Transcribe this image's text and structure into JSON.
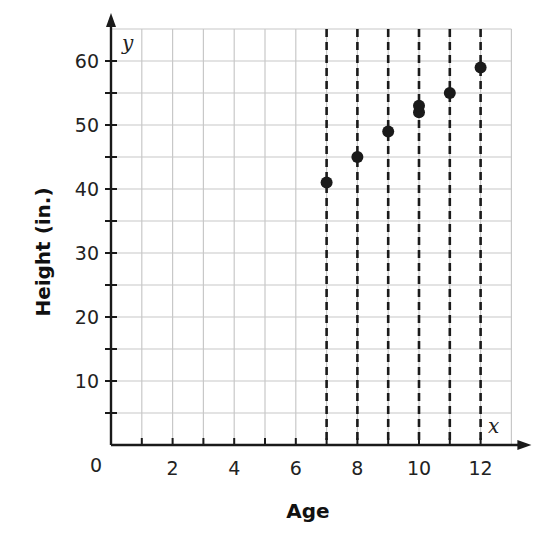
{
  "chart_data": {
    "type": "scatter",
    "title": "",
    "xlabel": "Age",
    "ylabel": "Height (in.)",
    "x_axis_variable": "x",
    "y_axis_variable": "y",
    "origin_label": "0",
    "xlim": [
      0,
      13
    ],
    "ylim": [
      0,
      65
    ],
    "x_ticks": [
      2,
      4,
      6,
      8,
      10,
      12
    ],
    "y_ticks": [
      10,
      20,
      30,
      40,
      50,
      60
    ],
    "grid": true,
    "x_grid_step": 1,
    "y_grid_step": 5,
    "dashed_vertical_lines_at_x": [
      7,
      8,
      9,
      10,
      11,
      12
    ],
    "series": [
      {
        "name": "Height vs Age",
        "points": [
          {
            "x": 7,
            "y": 41
          },
          {
            "x": 8,
            "y": 45
          },
          {
            "x": 9,
            "y": 49
          },
          {
            "x": 10,
            "y": 52
          },
          {
            "x": 10,
            "y": 53
          },
          {
            "x": 11,
            "y": 55
          },
          {
            "x": 12,
            "y": 59
          }
        ]
      }
    ],
    "legend": null
  },
  "colors": {
    "grid": "#c8c8c8",
    "axis": "#1a1a1a",
    "points": "#1a1a1a",
    "dashed": "#1a1a1a"
  }
}
